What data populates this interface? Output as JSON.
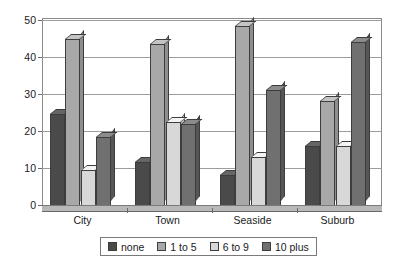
{
  "chart_data": {
    "type": "bar",
    "title": "",
    "subtitle": "",
    "xlabel": "",
    "ylabel": "",
    "categories": [
      "City",
      "Town",
      "Seaside",
      "Suburb"
    ],
    "series": [
      {
        "name": "none",
        "color": "#4a4a4a",
        "values": [
          24.5,
          11.5,
          8.0,
          16.0
        ]
      },
      {
        "name": "1 to 5",
        "color": "#a8a8a8",
        "values": [
          45.0,
          43.5,
          48.5,
          28.0
        ]
      },
      {
        "name": "6 to 9",
        "color": "#d8d8d8",
        "values": [
          9.5,
          22.5,
          13.0,
          16.0
        ]
      },
      {
        "name": "10 plus",
        "color": "#707070",
        "values": [
          18.5,
          22.0,
          31.0,
          44.0
        ]
      }
    ],
    "ylim": [
      0,
      50
    ],
    "yticks": [
      0,
      10,
      20,
      30,
      40,
      50
    ],
    "ytick_labels": [
      "0",
      "10",
      "20",
      "30",
      "40",
      "50"
    ],
    "grid": true,
    "grid_axis": "y",
    "legend_position": "bottom",
    "style": "3d-column-grayscale",
    "annotations": []
  },
  "legend": {
    "items": [
      {
        "label": "none",
        "swatch": "#4a4a4a"
      },
      {
        "label": "1 to 5",
        "swatch": "#a8a8a8"
      },
      {
        "label": "6 to 9",
        "swatch": "#d8d8d8"
      },
      {
        "label": "10 plus",
        "swatch": "#707070"
      }
    ]
  },
  "colors": {
    "background": "#ffffff",
    "frame": "#8a8a8a",
    "gridline": "#9d9d9d",
    "axis_text": "#1a1a1a",
    "bar_outline": "#3d3d3d",
    "floor": "#b8b8b8"
  }
}
